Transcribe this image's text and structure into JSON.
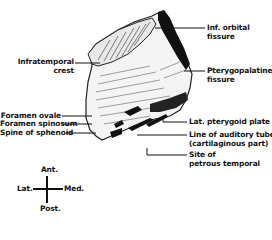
{
  "figure": {
    "type": "anatomical illustration",
    "labels_left": [
      {
        "id": "infratemporal-crest",
        "line1": "Infratemporal",
        "line2": "crest"
      },
      {
        "id": "foramen-ovale",
        "line1": "Foramen ovale"
      },
      {
        "id": "foramen-spinosum",
        "line1": "Foramen spinosum"
      },
      {
        "id": "spine-of-sphenoid",
        "line1": "Spine of sphenoid"
      }
    ],
    "labels_right": [
      {
        "id": "inf-orbital-fissure",
        "line1": "Inf. orbital",
        "line2": "fissure"
      },
      {
        "id": "pterygopalatine-fissure",
        "line1": "Pterygopalatine",
        "line2": "fissure"
      },
      {
        "id": "lat-pterygoid-plate",
        "line1": "Lat. pterygoid plate"
      },
      {
        "id": "line-of-auditory-tube",
        "line1": "Line of auditory tube",
        "line2": "(cartilaginous part)"
      },
      {
        "id": "site-of-petrous-temporal",
        "line1": "Site of",
        "line2": "petrous temporal"
      }
    ],
    "orientation": {
      "top": "Ant.",
      "bottom": "Post.",
      "left": "Lat.",
      "right": "Med."
    }
  }
}
